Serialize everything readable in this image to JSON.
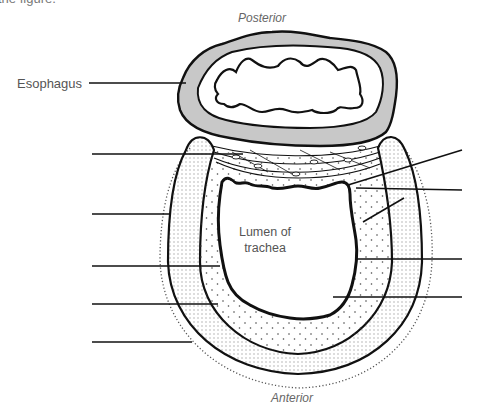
{
  "figure": {
    "cut_caption": "the figure.",
    "orientation": {
      "top": "Posterior",
      "bottom": "Anterior"
    },
    "labels": {
      "esophagus": "Esophagus",
      "lumen_line1": "Lumen of",
      "lumen_line2": "trachea"
    },
    "blank_leader_lines": {
      "left": [
        {
          "y": 154,
          "x1": 92,
          "x2": 243
        },
        {
          "y": 214,
          "x1": 92,
          "x2": 170
        },
        {
          "y": 266,
          "x1": 92,
          "x2": 218
        },
        {
          "y": 304,
          "x1": 92,
          "x2": 218
        },
        {
          "y": 342,
          "x1": 92,
          "x2": 192
        }
      ],
      "right": [
        {
          "x1": 462,
          "y1": 150,
          "x2": 348,
          "y2": 185
        },
        {
          "x1": 462,
          "y1": 190,
          "x2": 356,
          "y2": 187
        },
        {
          "x1": 404,
          "y1": 198,
          "x2": 363,
          "y2": 222
        },
        {
          "x1": 462,
          "y1": 259,
          "x2": 357,
          "y2": 259
        },
        {
          "x1": 462,
          "y1": 297,
          "x2": 333,
          "y2": 297
        }
      ]
    },
    "colors": {
      "ink": "#111111",
      "esophagus_wall": "#c8c8c8",
      "text": "#555555"
    }
  }
}
